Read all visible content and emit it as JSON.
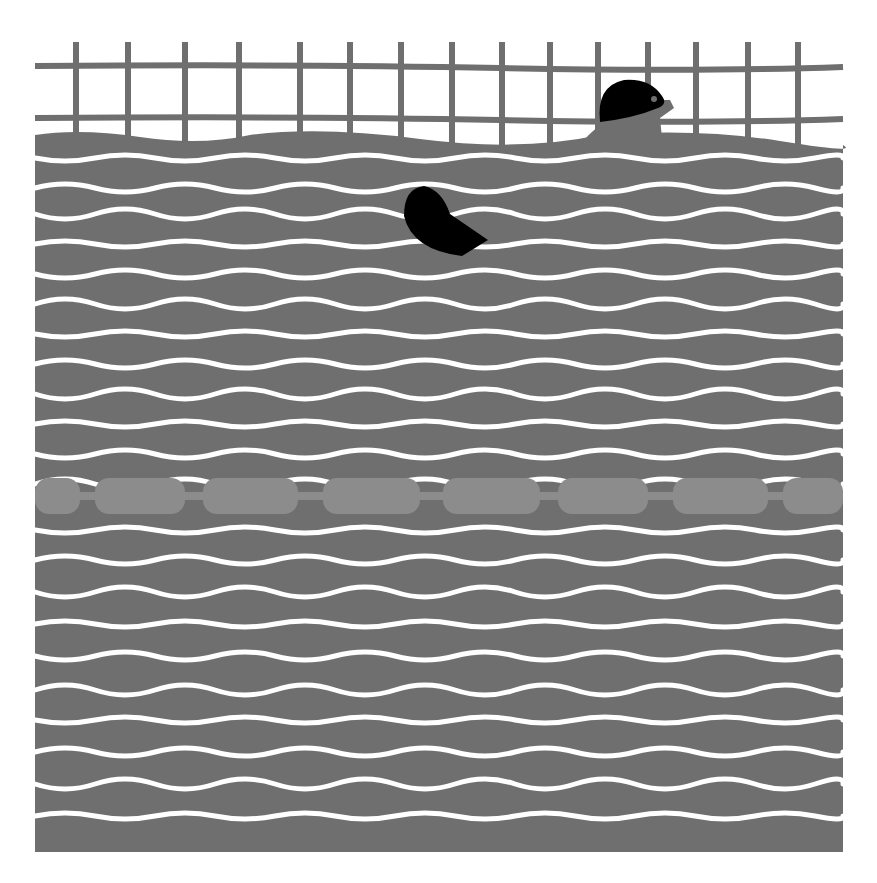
{
  "illustration": {
    "subject": "swimmers in a pool lane",
    "colors": {
      "background": "#ffffff",
      "water": "#6f6f6f",
      "grid": "#6f6f6f",
      "wave_line": "#ffffff",
      "buoy": "#8c8c8c",
      "cap": "#000000"
    },
    "grid": {
      "vertical_x": [
        76,
        128,
        185,
        239,
        300,
        350,
        401,
        452,
        502,
        550,
        598,
        648,
        696,
        748,
        798
      ],
      "horizontal_y": [
        66,
        118
      ],
      "left": 35,
      "right": 843,
      "top": 42
    },
    "water": {
      "left": 35,
      "right": 843,
      "top": 135,
      "bottom": 852
    },
    "wave_rows_y": [
      158,
      188,
      214,
      244,
      274,
      304,
      334,
      364,
      394,
      424,
      454,
      484,
      530,
      560,
      592,
      624,
      656,
      690,
      720,
      752,
      784,
      816
    ],
    "lane_rope": {
      "y": 496,
      "buoys_x": [
        [
          35,
          80
        ],
        [
          95,
          185
        ],
        [
          203,
          298
        ],
        [
          323,
          420
        ],
        [
          443,
          540
        ],
        [
          558,
          648
        ],
        [
          673,
          768
        ],
        [
          783,
          843
        ]
      ]
    },
    "swimmers": [
      {
        "name": "swimmer-top",
        "cap_center": [
          624,
          104
        ]
      },
      {
        "name": "swimmer-middle",
        "cap_center": [
          432,
          220
        ]
      }
    ]
  }
}
